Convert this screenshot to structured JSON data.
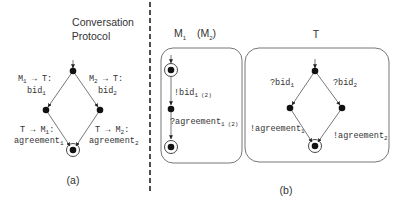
{
  "panel_a": {
    "title_line1": "Conversation",
    "title_line2": "Protocol",
    "caption": "(a)",
    "edges": {
      "top_left": {
        "line1": "M",
        "line1_sub": "1",
        "line1_rest": " → T:",
        "line2": "bid",
        "line2_sub": "1"
      },
      "top_right": {
        "line1": "M",
        "line1_sub": "2",
        "line1_rest": " → T:",
        "line2": "bid",
        "line2_sub": "2"
      },
      "bottom_left": {
        "line1": "T → M",
        "line1_sub": "1",
        "line1_rest": ":",
        "line2": "agreement",
        "line2_sub": "1"
      },
      "bottom_right": {
        "line1": "T → M",
        "line1_sub": "2",
        "line1_rest": ":",
        "line2": "agreement",
        "line2_sub": "2"
      }
    }
  },
  "panel_b": {
    "caption": "(b)",
    "machine_m": {
      "label": "M",
      "label_sub": "1",
      "alt_label_open": "(M",
      "alt_label_sub": "2",
      "alt_label_close": ")",
      "edges": {
        "send_bid": {
          "text": "!bid",
          "sub": "1",
          "alt": "(2)"
        },
        "recv_agreement": {
          "text": "?agreement",
          "sub": "1",
          "alt": "(2)"
        }
      }
    },
    "machine_t": {
      "label": "T",
      "edges": {
        "recv_bid1": {
          "text": "?bid",
          "sub": "1"
        },
        "recv_bid2": {
          "text": "?bid",
          "sub": "2"
        },
        "send_agreement1": {
          "text": "!agreement",
          "sub": "1"
        },
        "send_agreement2": {
          "text": "!agreement",
          "sub": "2"
        }
      }
    }
  },
  "colors": {
    "ink": "#333333",
    "node": "#111111",
    "divider": "#222222"
  }
}
